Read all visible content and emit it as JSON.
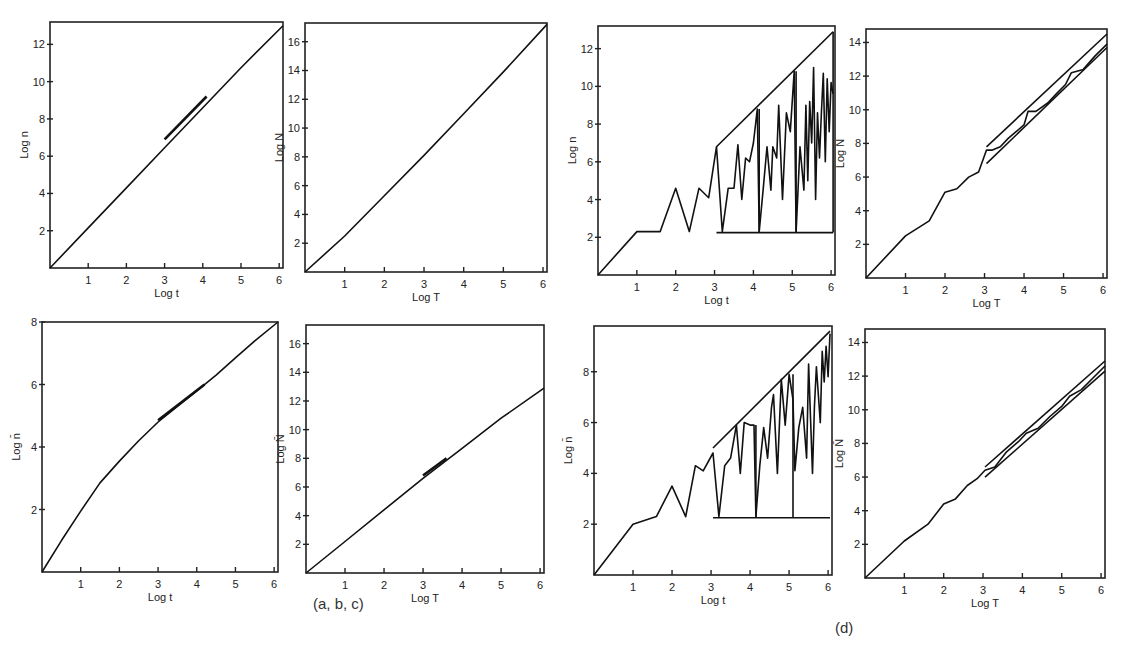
{
  "captions": {
    "left_group": "(a, b, c)",
    "right_group": "(d)"
  },
  "chart_data": [
    {
      "id": "p1",
      "type": "line",
      "frame": [
        50,
        22,
        283,
        268
      ],
      "xlabel": "Log t",
      "ylabel": "Log n",
      "xlim": [
        0,
        6.1
      ],
      "ylim": [
        0,
        13.2
      ],
      "xticks": [
        1,
        2,
        3,
        4,
        5,
        6
      ],
      "yticks": [
        2,
        4,
        6,
        8,
        10,
        12
      ],
      "series": [
        {
          "name": "main",
          "x": [
            0,
            1,
            2,
            3,
            4,
            5,
            6.1
          ],
          "y": [
            0,
            2.15,
            4.3,
            6.45,
            8.6,
            10.75,
            13.0
          ]
        },
        {
          "name": "thick",
          "width": 2.6,
          "x": [
            3,
            4.1
          ],
          "y": [
            6.9,
            9.2
          ]
        }
      ]
    },
    {
      "id": "p2",
      "type": "line",
      "frame": [
        305,
        23,
        547,
        272
      ],
      "xlabel": "Log T",
      "ylabel": "Log N",
      "xlim": [
        0,
        6.1
      ],
      "ylim": [
        0,
        17.3
      ],
      "xticks": [
        1,
        2,
        3,
        4,
        5,
        6
      ],
      "yticks": [
        2,
        4,
        6,
        8,
        10,
        12,
        14,
        16
      ],
      "series": [
        {
          "name": "main",
          "x": [
            0,
            1,
            2,
            3,
            4,
            5,
            6.1
          ],
          "y": [
            0,
            2.5,
            5.3,
            8.1,
            11,
            13.9,
            17.2
          ]
        }
      ]
    },
    {
      "id": "p3",
      "type": "line",
      "frame": [
        598,
        26,
        835,
        275
      ],
      "xlabel": "Log t",
      "ylabel": "Log n",
      "xlim": [
        0,
        6.1
      ],
      "ylim": [
        0,
        13.2
      ],
      "xticks": [
        1,
        2,
        3,
        4,
        5,
        6
      ],
      "yticks": [
        2,
        4,
        6,
        8,
        10,
        12
      ],
      "series": [
        {
          "name": "fluctuating",
          "x": [
            0,
            1,
            1.2,
            1.6,
            2,
            2.35,
            2.6,
            2.85,
            3.05,
            3.2,
            3.35,
            3.5,
            3.6,
            3.7,
            3.8,
            3.9,
            4.0,
            4.1,
            4.15,
            4.25,
            4.35,
            4.45,
            4.5,
            4.6,
            4.65,
            4.75,
            4.85,
            4.95,
            5.05,
            5.1,
            5.15,
            5.2,
            5.3,
            5.35,
            5.4,
            5.45,
            5.5,
            5.55,
            5.6,
            5.65,
            5.7,
            5.75,
            5.8,
            5.85,
            5.9,
            5.95,
            6.0,
            6.05
          ],
          "y": [
            0,
            2.3,
            2.3,
            2.3,
            4.6,
            2.3,
            4.6,
            4.1,
            6.8,
            2.3,
            4.6,
            4.6,
            6.9,
            4.0,
            6.2,
            6.0,
            7.0,
            8.8,
            2.3,
            4.5,
            6.8,
            4.5,
            6.8,
            6.2,
            9.0,
            4.0,
            8.6,
            7.6,
            10.8,
            2.3,
            4.6,
            6.8,
            4.5,
            9.0,
            5.0,
            9.2,
            7.0,
            11.0,
            4.0,
            8.6,
            6.2,
            8.6,
            10.7,
            6.0,
            10.4,
            7.6,
            10.2,
            9.6
          ]
        },
        {
          "name": "upper-envelope",
          "x": [
            3.05,
            6.05
          ],
          "y": [
            6.8,
            12.9
          ]
        },
        {
          "name": "lower-bound",
          "x": [
            3.05,
            6.05
          ],
          "y": [
            2.25,
            2.25
          ]
        },
        {
          "name": "drop-4.15",
          "x": [
            4.15,
            4.15
          ],
          "y": [
            8.8,
            2.25
          ]
        },
        {
          "name": "drop-5.1",
          "x": [
            5.1,
            5.1
          ],
          "y": [
            10.8,
            2.25
          ]
        },
        {
          "name": "right-drop",
          "x": [
            6.05,
            6.05
          ],
          "y": [
            12.9,
            2.25
          ]
        }
      ]
    },
    {
      "id": "p4",
      "type": "line",
      "frame": [
        866,
        29,
        1107,
        278
      ],
      "xlabel": "Log T",
      "ylabel": "Log N",
      "xlim": [
        0,
        6.1
      ],
      "ylim": [
        0,
        14.8
      ],
      "xticks": [
        1,
        2,
        3,
        4,
        5,
        6
      ],
      "yticks": [
        2,
        4,
        6,
        8,
        10,
        12,
        14
      ],
      "series": [
        {
          "name": "main",
          "x": [
            0,
            1,
            1.6,
            2,
            2.3,
            2.6,
            2.85,
            3.05,
            3.2,
            3.4,
            3.6,
            3.8,
            4.0,
            4.1,
            4.3,
            4.6,
            4.8,
            5.05,
            5.2,
            5.5,
            5.8,
            6.1
          ],
          "y": [
            0,
            2.5,
            3.4,
            5.1,
            5.3,
            6.0,
            6.3,
            7.6,
            7.6,
            7.8,
            8.3,
            8.7,
            9.1,
            9.9,
            9.9,
            10.4,
            10.9,
            11.5,
            12.2,
            12.4,
            13.2,
            13.9
          ]
        },
        {
          "name": "upper-envelope",
          "x": [
            3.05,
            6.1
          ],
          "y": [
            7.8,
            14.5
          ]
        },
        {
          "name": "lower-envelope",
          "x": [
            3.05,
            6.1
          ],
          "y": [
            6.8,
            13.7
          ]
        }
      ]
    },
    {
      "id": "p5",
      "type": "line",
      "frame": [
        42,
        322,
        278,
        572
      ],
      "xlabel": "Log t",
      "ylabel": "Log n̄",
      "xlim": [
        0,
        6.1
      ],
      "ylim": [
        0,
        8.0
      ],
      "xticks": [
        1,
        2,
        3,
        4,
        5,
        6
      ],
      "yticks": [
        2,
        4,
        6,
        8
      ],
      "series": [
        {
          "name": "main",
          "x": [
            0,
            0.5,
            1,
            1.5,
            2,
            2.5,
            3,
            3.5,
            4,
            4.5,
            5,
            5.5,
            6.1
          ],
          "y": [
            0,
            1.0,
            1.95,
            2.85,
            3.55,
            4.2,
            4.8,
            5.3,
            5.8,
            6.3,
            6.85,
            7.4,
            8.0
          ]
        },
        {
          "name": "thick",
          "width": 2.6,
          "x": [
            3,
            4.2
          ],
          "y": [
            4.85,
            6.0
          ]
        }
      ]
    },
    {
      "id": "p6",
      "type": "line",
      "frame": [
        306,
        325,
        544,
        573
      ],
      "xlabel": "Log T",
      "ylabel": "Log N̄",
      "xlim": [
        0,
        6.1
      ],
      "ylim": [
        0,
        17.3
      ],
      "xticks": [
        1,
        2,
        3,
        4,
        5,
        6
      ],
      "yticks": [
        2,
        4,
        6,
        8,
        10,
        12,
        14,
        16
      ],
      "series": [
        {
          "name": "main",
          "x": [
            0,
            1,
            2,
            3,
            4,
            5,
            6.1
          ],
          "y": [
            0,
            2.2,
            4.4,
            6.6,
            8.7,
            10.8,
            12.9
          ]
        },
        {
          "name": "thick",
          "width": 2.6,
          "x": [
            3,
            3.6
          ],
          "y": [
            6.8,
            8.0
          ]
        }
      ]
    },
    {
      "id": "p7",
      "type": "line",
      "frame": [
        594,
        326,
        832,
        575
      ],
      "xlabel": "Log t",
      "ylabel": "Log n̄",
      "xlim": [
        0,
        6.1
      ],
      "ylim": [
        0,
        9.8
      ],
      "xticks": [
        1,
        2,
        3,
        4,
        5,
        6
      ],
      "yticks": [
        2,
        4,
        6,
        8
      ],
      "series": [
        {
          "name": "fluctuating",
          "x": [
            0,
            1,
            1.6,
            2,
            2.35,
            2.6,
            2.8,
            3.05,
            3.2,
            3.35,
            3.5,
            3.65,
            3.75,
            3.85,
            4.0,
            4.1,
            4.15,
            4.25,
            4.35,
            4.45,
            4.55,
            4.6,
            4.7,
            4.8,
            4.9,
            5.0,
            5.1,
            5.15,
            5.25,
            5.35,
            5.45,
            5.5,
            5.6,
            5.65,
            5.7,
            5.8,
            5.85,
            5.9,
            5.95,
            6.0,
            6.05
          ],
          "y": [
            0,
            2.0,
            2.3,
            3.5,
            2.3,
            4.3,
            4.1,
            4.8,
            2.3,
            4.3,
            4.6,
            5.9,
            4.0,
            6.0,
            5.9,
            5.9,
            2.3,
            4.3,
            5.8,
            4.6,
            6.6,
            7.1,
            4.0,
            7.7,
            5.9,
            7.9,
            6.9,
            4.1,
            5.8,
            6.6,
            4.6,
            8.3,
            4.0,
            6.6,
            8.2,
            6.0,
            8.8,
            7.6,
            9.0,
            7.8,
            9.5
          ]
        },
        {
          "name": "upper-envelope",
          "x": [
            3.05,
            6.05
          ],
          "y": [
            5.0,
            9.6
          ]
        },
        {
          "name": "lower-bound",
          "x": [
            3.05,
            6.05
          ],
          "y": [
            2.25,
            2.25
          ]
        },
        {
          "name": "drop-4.15",
          "x": [
            4.15,
            4.15
          ],
          "y": [
            5.9,
            2.25
          ]
        },
        {
          "name": "drop-5.1",
          "x": [
            5.1,
            5.1
          ],
          "y": [
            7.9,
            2.25
          ]
        }
      ]
    },
    {
      "id": "p8",
      "type": "line",
      "frame": [
        865,
        329,
        1105,
        578
      ],
      "xlabel": "Log T",
      "ylabel": "Log N̄",
      "xlim": [
        0,
        6.1
      ],
      "ylim": [
        0,
        14.8
      ],
      "xticks": [
        1,
        2,
        3,
        4,
        5,
        6
      ],
      "yticks": [
        2,
        4,
        6,
        8,
        10,
        12,
        14
      ],
      "series": [
        {
          "name": "main",
          "x": [
            0,
            1,
            1.6,
            2,
            2.3,
            2.6,
            2.85,
            3.05,
            3.3,
            3.6,
            3.9,
            4.1,
            4.4,
            4.7,
            5.0,
            5.2,
            5.5,
            5.8,
            6.1
          ],
          "y": [
            0,
            2.2,
            3.2,
            4.4,
            4.7,
            5.5,
            5.9,
            6.4,
            6.6,
            7.5,
            8.1,
            8.6,
            8.9,
            9.6,
            10.2,
            10.8,
            11.2,
            11.9,
            12.6
          ]
        },
        {
          "name": "upper-envelope",
          "x": [
            3.05,
            6.1
          ],
          "y": [
            6.6,
            12.9
          ]
        },
        {
          "name": "lower-envelope",
          "x": [
            3.05,
            6.1
          ],
          "y": [
            6.0,
            12.3
          ]
        }
      ]
    }
  ]
}
